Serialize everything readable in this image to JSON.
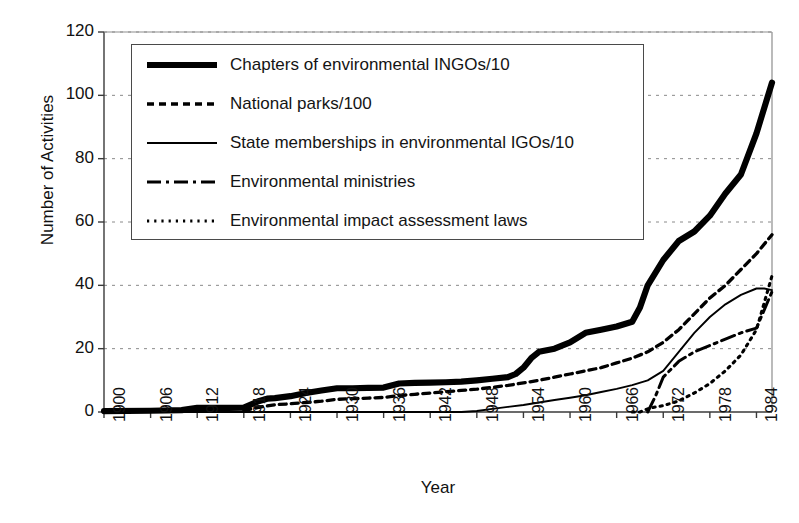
{
  "chart_data": {
    "type": "line",
    "title": "",
    "xlabel": "Year",
    "ylabel": "Number of Activities",
    "xlim": [
      1900,
      1986
    ],
    "ylim": [
      0,
      120
    ],
    "ytick_labels": [
      "0",
      "20",
      "40",
      "60",
      "80",
      "100",
      "120"
    ],
    "ytick_values": [
      0,
      20,
      40,
      60,
      80,
      100,
      120
    ],
    "xtick_labels": [
      "1900",
      "1906",
      "1912",
      "1918",
      "1924",
      "1930",
      "1936",
      "1942",
      "1948",
      "1954",
      "1960",
      "1966",
      "1972",
      "1978",
      "1984"
    ],
    "xtick_values": [
      1900,
      1906,
      1912,
      1918,
      1924,
      1930,
      1936,
      1942,
      1948,
      1954,
      1960,
      1966,
      1972,
      1978,
      1984
    ],
    "grid": "horizontal-dotted",
    "legend_position": "upper-left-inside",
    "line_color": "#000000",
    "series": [
      {
        "name": "Chapters of environmental INGOs/10",
        "style": "thick-solid",
        "x": [
          1900,
          1906,
          1910,
          1912,
          1914,
          1916,
          1918,
          1920,
          1921,
          1922,
          1924,
          1926,
          1928,
          1930,
          1932,
          1934,
          1936,
          1938,
          1940,
          1942,
          1944,
          1946,
          1948,
          1950,
          1952,
          1953,
          1954,
          1955,
          1956,
          1958,
          1960,
          1962,
          1964,
          1966,
          1968,
          1969,
          1970,
          1972,
          1974,
          1976,
          1978,
          1980,
          1982,
          1984,
          1986
        ],
        "y": [
          0.3,
          0.4,
          0.6,
          1.3,
          1.3,
          1.3,
          1.4,
          3.5,
          4.2,
          4.4,
          5.0,
          6.0,
          6.8,
          7.5,
          7.5,
          7.6,
          7.7,
          9.0,
          9.2,
          9.3,
          9.4,
          9.6,
          10.0,
          10.5,
          11.0,
          12.0,
          14.0,
          17.0,
          19.0,
          20.0,
          22.0,
          25.0,
          26.0,
          27.0,
          28.5,
          33.0,
          40.0,
          48.0,
          54.0,
          57.0,
          62.0,
          69.0,
          75.0,
          88.0,
          104.0
        ]
      },
      {
        "name": "National parks/100",
        "style": "medium-dashed",
        "x": [
          1918,
          1920,
          1922,
          1924,
          1926,
          1928,
          1930,
          1932,
          1934,
          1936,
          1938,
          1940,
          1942,
          1944,
          1946,
          1948,
          1950,
          1952,
          1954,
          1956,
          1958,
          1960,
          1962,
          1964,
          1966,
          1968,
          1970,
          1972,
          1974,
          1976,
          1978,
          1980,
          1982,
          1984,
          1986
        ],
        "y": [
          0.5,
          1.5,
          2.3,
          2.6,
          3.0,
          3.4,
          4.0,
          4.2,
          4.4,
          4.6,
          5.2,
          5.6,
          6.0,
          6.4,
          6.8,
          7.2,
          7.8,
          8.4,
          9.2,
          10.0,
          11.0,
          12.0,
          13.0,
          14.0,
          15.5,
          17.0,
          19.0,
          22.0,
          26.0,
          31.0,
          36.0,
          40.0,
          45.0,
          50.0,
          56.0
        ]
      },
      {
        "name": "State memberships in environmental IGOs/10",
        "style": "thin-solid",
        "x": [
          1900,
          1946,
          1948,
          1950,
          1952,
          1954,
          1956,
          1958,
          1960,
          1962,
          1964,
          1966,
          1968,
          1970,
          1972,
          1974,
          1976,
          1978,
          1980,
          1982,
          1984,
          1985,
          1986
        ],
        "y": [
          0,
          0,
          0.3,
          1.0,
          1.6,
          2.2,
          3.0,
          3.8,
          4.5,
          5.3,
          6.3,
          7.3,
          8.5,
          10.0,
          13.0,
          19.0,
          25.0,
          30.0,
          34.0,
          37.0,
          39.0,
          39.0,
          38.5
        ]
      },
      {
        "name": "Environmental ministries",
        "style": "dash-dot",
        "x": [
          1970,
          1971,
          1972,
          1974,
          1976,
          1978,
          1980,
          1982,
          1984,
          1986
        ],
        "y": [
          0,
          5.0,
          11.0,
          16.0,
          19.0,
          21.0,
          23.0,
          25.0,
          26.5,
          38.0
        ]
      },
      {
        "name": "Environmental impact assessment laws",
        "style": "fine-dotted",
        "x": [
          1968,
          1969,
          1970,
          1971,
          1972,
          1974,
          1976,
          1978,
          1980,
          1982,
          1984,
          1986
        ],
        "y": [
          0,
          0,
          1.0,
          1.6,
          2.0,
          3.5,
          6.0,
          9.0,
          13.0,
          18.0,
          26.0,
          43.0
        ]
      }
    ]
  },
  "axes": {
    "y_title": "Number of Activities",
    "x_title": "Year"
  },
  "legend": {
    "items": [
      {
        "label": "Chapters of environmental INGOs/10",
        "style": "thick-solid"
      },
      {
        "label": "National parks/100",
        "style": "medium-dashed"
      },
      {
        "label": "State memberships in environmental IGOs/10",
        "style": "thin-solid"
      },
      {
        "label": "Environmental ministries",
        "style": "dash-dot"
      },
      {
        "label": "Environmental impact assessment laws",
        "style": "fine-dotted"
      }
    ]
  }
}
